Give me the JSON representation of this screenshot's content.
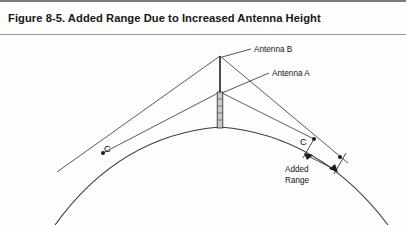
{
  "figure": {
    "title": "Figure 8-5. Added Range Due to Increased Antenna Height",
    "caption_number": "8-5"
  },
  "diagram": {
    "type": "geometric-line-diagram",
    "background_color": "#fdfdfd",
    "line_color": "#3a3a3a",
    "labels": {
      "antenna_b": "Antenna B",
      "antenna_a": "Antenna A",
      "c_left": "C",
      "c_right": "C",
      "added_range_line1": "Added",
      "added_range_line2": "Range"
    },
    "elements": {
      "earth_arc": "curved horizon arc spanning the full figure width",
      "mast": "vertical antenna mast rising from the arc apex",
      "mast_lower_hatched": "hatched lower mast section below Antenna A",
      "tangent_lines_a": "two sight lines from Antenna A to the left and right C points",
      "tangent_lines_b": "two sight lines from Antenna B to the farther left and right C points",
      "added_range_dimension": "double-headed arrow between the two right-hand horizon points"
    }
  }
}
